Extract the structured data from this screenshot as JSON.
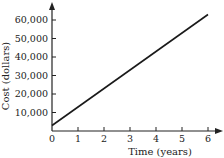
{
  "chart_data": {
    "type": "line",
    "title": "",
    "xlabel": "Time (years)",
    "ylabel": "Cost (dollars)",
    "x_ticks": [
      "0",
      "1",
      "2",
      "3",
      "4",
      "5",
      "6"
    ],
    "y_ticks": [
      "10,000",
      "20,000",
      "30,000",
      "40,000",
      "50,000",
      "60,000"
    ],
    "xlim": [
      0,
      6.5
    ],
    "ylim": [
      0,
      70000
    ],
    "grid": false,
    "legend": null,
    "series": [
      {
        "name": "Cost",
        "x": [
          0,
          6
        ],
        "y": [
          3000,
          63000
        ]
      }
    ]
  }
}
